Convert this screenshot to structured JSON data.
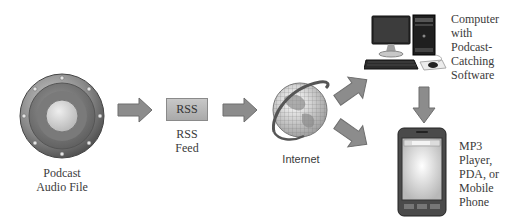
{
  "diagram": {
    "nodes": [
      {
        "id": "podcast-audio-file",
        "label_lines": [
          "Podcast",
          "Audio File"
        ],
        "icon": "speaker-icon"
      },
      {
        "id": "rss-feed",
        "box_text": "RSS",
        "label_lines": [
          "RSS",
          "Feed"
        ],
        "icon": "rss-box"
      },
      {
        "id": "internet",
        "label_lines": [
          "Internet"
        ],
        "icon": "globe-icon"
      },
      {
        "id": "computer",
        "label_lines": [
          "Computer",
          "with",
          "Podcast-",
          "Catching",
          "Software"
        ],
        "icon": "desktop-computer-icon"
      },
      {
        "id": "mobile-device",
        "label_lines": [
          "MP3",
          "Player,",
          "PDA, or",
          "Mobile",
          "Phone"
        ],
        "icon": "pda-icon"
      }
    ],
    "edges": [
      {
        "from": "podcast-audio-file",
        "to": "rss-feed",
        "direction": "right"
      },
      {
        "from": "rss-feed",
        "to": "internet",
        "direction": "right"
      },
      {
        "from": "internet",
        "to": "computer",
        "direction": "up-right"
      },
      {
        "from": "internet",
        "to": "mobile-device",
        "direction": "down-right"
      },
      {
        "from": "computer",
        "to": "mobile-device",
        "direction": "down"
      }
    ],
    "colors": {
      "arrow_fill": "#8c8c8c",
      "arrow_stroke": "#6e6e6e",
      "text": "#3a3a3a",
      "background": "#ffffff"
    }
  }
}
